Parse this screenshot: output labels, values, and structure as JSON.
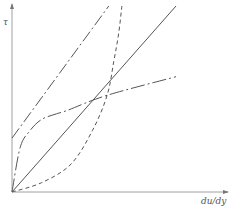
{
  "chart_data": {
    "type": "line",
    "title": "",
    "xlabel": "du/dy",
    "ylabel": "τ",
    "grid": false,
    "legend": null,
    "axis_ticks": "none",
    "series": [
      {
        "name": "newtonian",
        "style": "solid",
        "description": "straight line through origin",
        "points": [
          [
            0,
            0
          ],
          [
            1,
            1
          ]
        ]
      },
      {
        "name": "bingham-plastic",
        "style": "dash-dot",
        "description": "straight line with yield-stress intercept",
        "points": [
          [
            0,
            0.29
          ],
          [
            0.59,
            1
          ]
        ]
      },
      {
        "name": "pseudoplastic",
        "style": "dash-dot",
        "description": "shear-thinning curve through origin, concave down",
        "points": [
          [
            0,
            0
          ],
          [
            0.05,
            0.24
          ],
          [
            0.11,
            0.33
          ],
          [
            0.18,
            0.39
          ],
          [
            0.27,
            0.42
          ],
          [
            0.34,
            0.44
          ],
          [
            0.58,
            0.52
          ],
          [
            1.0,
            0.62
          ]
        ]
      },
      {
        "name": "dilatant",
        "style": "dashed",
        "description": "shear-thickening curve through origin, concave up",
        "points": [
          [
            0,
            0
          ],
          [
            0.18,
            0.05
          ],
          [
            0.36,
            0.15
          ],
          [
            0.49,
            0.33
          ],
          [
            0.58,
            0.52
          ],
          [
            0.62,
            0.7
          ],
          [
            0.65,
            0.85
          ],
          [
            0.67,
            1.0
          ]
        ]
      }
    ]
  },
  "labels": {
    "y_axis": "τ",
    "x_axis": "du/dy"
  },
  "colors": {
    "axis": "#9a9a9a",
    "line": "#555555"
  }
}
